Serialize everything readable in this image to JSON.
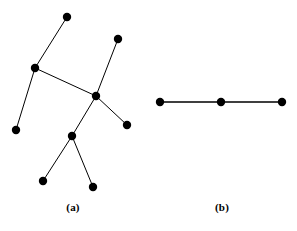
{
  "figure": {
    "background_color": "#ffffff",
    "ink_color": "#000000",
    "width": 297,
    "height": 231,
    "panels": [
      {
        "id": "a",
        "caption": "(a)",
        "caption_x": 73,
        "caption_y": 201,
        "description": "tree graph with nine vertices and eight edges",
        "vertex_radius": 4.2,
        "edge_width": 1.0,
        "vertices": [
          {
            "id": "v1",
            "x": 67,
            "y": 17,
            "role": "leaf"
          },
          {
            "id": "v2",
            "x": 118,
            "y": 39,
            "role": "leaf"
          },
          {
            "id": "v3",
            "x": 35,
            "y": 68,
            "role": "branch"
          },
          {
            "id": "v4",
            "x": 96,
            "y": 96,
            "role": "branch"
          },
          {
            "id": "v5",
            "x": 16,
            "y": 130,
            "role": "leaf"
          },
          {
            "id": "v6",
            "x": 127,
            "y": 125,
            "role": "leaf"
          },
          {
            "id": "v7",
            "x": 72,
            "y": 136,
            "role": "branch"
          },
          {
            "id": "v8",
            "x": 43,
            "y": 181,
            "role": "leaf"
          },
          {
            "id": "v9",
            "x": 93,
            "y": 187,
            "role": "leaf"
          }
        ],
        "edges": [
          {
            "from": "v1",
            "to": "v3"
          },
          {
            "from": "v3",
            "to": "v4"
          },
          {
            "from": "v3",
            "to": "v5"
          },
          {
            "from": "v2",
            "to": "v4"
          },
          {
            "from": "v4",
            "to": "v6"
          },
          {
            "from": "v4",
            "to": "v7"
          },
          {
            "from": "v7",
            "to": "v8"
          },
          {
            "from": "v7",
            "to": "v9"
          }
        ]
      },
      {
        "id": "b",
        "caption": "(b)",
        "caption_x": 222,
        "caption_y": 201,
        "description": "path graph with three vertices and two edges",
        "vertex_radius": 4.2,
        "edge_width": 1.3,
        "vertices": [
          {
            "id": "u1",
            "x": 160,
            "y": 102,
            "role": "leaf"
          },
          {
            "id": "u2",
            "x": 221,
            "y": 102,
            "role": "branch"
          },
          {
            "id": "u3",
            "x": 282,
            "y": 102,
            "role": "leaf"
          }
        ],
        "edges": [
          {
            "from": "u1",
            "to": "u2"
          },
          {
            "from": "u2",
            "to": "u3"
          }
        ]
      }
    ]
  },
  "chart_data": {
    "type": "diagram",
    "title": "",
    "subtitle": "",
    "xlabel": "",
    "ylabel": "",
    "legend": [],
    "annotations": [
      "(a)",
      "(b)"
    ],
    "graphs": [
      {
        "name": "(a)",
        "node_count": 9,
        "edge_count": 8,
        "nodes": [
          "v1",
          "v2",
          "v3",
          "v4",
          "v5",
          "v6",
          "v7",
          "v8",
          "v9"
        ],
        "node_positions": [
          [
            67,
            17
          ],
          [
            118,
            39
          ],
          [
            35,
            68
          ],
          [
            96,
            96
          ],
          [
            16,
            130
          ],
          [
            127,
            125
          ],
          [
            72,
            136
          ],
          [
            43,
            181
          ],
          [
            93,
            187
          ]
        ],
        "edges": [
          [
            "v1",
            "v3"
          ],
          [
            "v3",
            "v4"
          ],
          [
            "v3",
            "v5"
          ],
          [
            "v2",
            "v4"
          ],
          [
            "v4",
            "v6"
          ],
          [
            "v4",
            "v7"
          ],
          [
            "v7",
            "v8"
          ],
          [
            "v7",
            "v9"
          ]
        ],
        "degrees": {
          "v1": 1,
          "v2": 1,
          "v3": 3,
          "v4": 4,
          "v5": 1,
          "v6": 1,
          "v7": 3,
          "v8": 1,
          "v9": 1
        }
      },
      {
        "name": "(b)",
        "node_count": 3,
        "edge_count": 2,
        "nodes": [
          "u1",
          "u2",
          "u3"
        ],
        "node_positions": [
          [
            160,
            102
          ],
          [
            221,
            102
          ],
          [
            282,
            102
          ]
        ],
        "edges": [
          [
            "u1",
            "u2"
          ],
          [
            "u2",
            "u3"
          ]
        ],
        "degrees": {
          "u1": 1,
          "u2": 2,
          "u3": 1
        }
      }
    ]
  }
}
